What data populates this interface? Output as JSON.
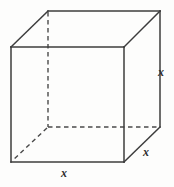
{
  "figure": {
    "name": "cube-diagram",
    "background_color": "#fdfdfc",
    "line_color": "#3c3c3c",
    "hidden_line_color": "#4a4a4a",
    "label_color": "#2e2e2e"
  },
  "labels": {
    "right_edge": "x",
    "bottom_edge": "x",
    "depth_edge": "x"
  },
  "geometry": {
    "front_face": {
      "top_left": [
        11,
        47
      ],
      "top_right": [
        124,
        47
      ],
      "bottom_right": [
        124,
        162
      ],
      "bottom_left": [
        11,
        162
      ]
    },
    "back_face": {
      "top_left": [
        48,
        11
      ],
      "top_right": [
        160,
        11
      ],
      "bottom_right": [
        160,
        127
      ],
      "bottom_left": [
        48,
        127
      ]
    },
    "hidden_edges": [
      [
        [
          48,
          11
        ],
        [
          48,
          127
        ]
      ],
      [
        [
          48,
          127
        ],
        [
          160,
          127
        ]
      ],
      [
        [
          48,
          127
        ],
        [
          11,
          162
        ]
      ]
    ]
  }
}
